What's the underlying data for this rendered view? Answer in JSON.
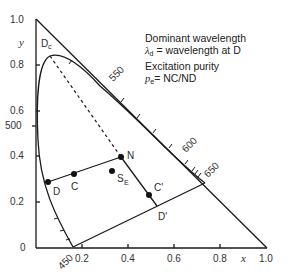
{
  "diagram": {
    "type": "CIE chromaticity diagram (x,y) illustrating dominant wavelength and excitation purity",
    "axes": {
      "x_label": "x",
      "y_label": "y",
      "x_ticks": [
        "0.2",
        "0.4",
        "0.6",
        "0.8",
        "1.0"
      ],
      "y_ticks": [
        "0",
        "0.2",
        "0.4",
        "0.6",
        "0.8",
        "1.0"
      ]
    },
    "wavelength_labels": [
      "450",
      "500",
      "550",
      "600",
      "650"
    ],
    "points": {
      "N": "N",
      "C": "C",
      "D": "D",
      "S_E_main": "S",
      "S_E_sub": "E",
      "C_prime": "C'",
      "D_prime": "D'",
      "D_c_main": "D",
      "D_c_sub": "c"
    },
    "legend": {
      "line1": "Dominant wavelength",
      "line2_symbol": "λ",
      "line2_sub": "d",
      "line2_text": " = wavelength at D",
      "line3": "Excitation purity",
      "line4_symbol": "p",
      "line4_sub": "e",
      "line4_text": "= NC/ND"
    },
    "colors": {
      "line": "#1a1a1a",
      "text": "#2a2a2a",
      "background": "#ffffff"
    }
  }
}
